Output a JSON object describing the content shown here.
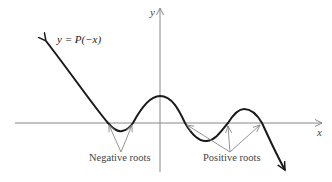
{
  "diagram": {
    "curve_label": "y = P(−x)",
    "x_axis_label": "x",
    "y_axis_label": "y",
    "annotations": {
      "negative": "Negative roots",
      "positive": "Positive roots"
    },
    "colors": {
      "curve": "#1a1a1a",
      "axes": "#888888",
      "pointers": "#888888",
      "text": "#444444"
    }
  }
}
